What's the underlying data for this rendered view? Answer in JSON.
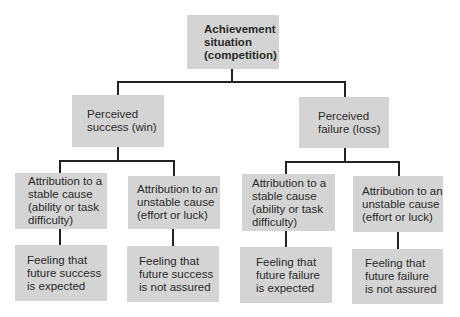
{
  "diagram": {
    "root": {
      "label": "Achievement\nsituation\n(competition)"
    },
    "branches": [
      {
        "label": "Perceived\nsuccess (win)",
        "children": [
          {
            "attribution": "Attribution to a\nstable cause\n(ability or task\ndifficulty)",
            "feeling": "Feeling that\nfuture success\nis expected"
          },
          {
            "attribution": "Attribution to an\nunstable cause\n(effort or luck)",
            "feeling": "Feeling that\nfuture success\nis not assured"
          }
        ]
      },
      {
        "label": "Perceived\nfailure (loss)",
        "children": [
          {
            "attribution": "Attribution to a\nstable cause\n(ability or task\ndifficulty)",
            "feeling": "Feeling that\nfuture failure\nis expected"
          },
          {
            "attribution": "Attribution to an\nunstable cause\n(effort or luck)",
            "feeling": "Feeling that\nfuture failure\nis not assured"
          }
        ]
      }
    ],
    "colors": {
      "box_fill": "#d4d4d4",
      "line": "#222222",
      "text": "#2a2a2a"
    }
  }
}
